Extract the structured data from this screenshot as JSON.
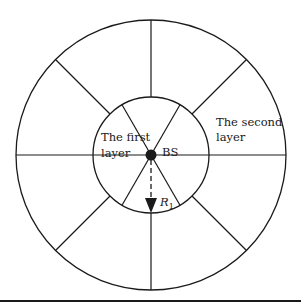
{
  "diagram": {
    "labels": {
      "first_layer_line1": "The first",
      "first_layer_line2": "layer",
      "second_layer_line1": "The second",
      "second_layer_line2": "layer",
      "base_station": "BS",
      "radius": "R",
      "radius_subscript": "1"
    },
    "geometry": {
      "center": [
        151,
        155
      ],
      "outer_radius": 135,
      "inner_radius": 58,
      "inner_spoke_angles_deg": [
        0,
        60,
        120,
        180,
        240,
        300
      ],
      "outer_spoke_angles_deg": [
        0,
        45,
        90,
        135,
        180,
        225,
        270,
        315
      ]
    },
    "colors": {
      "stroke": "#1a1a1a",
      "background": "#ffffff"
    }
  }
}
